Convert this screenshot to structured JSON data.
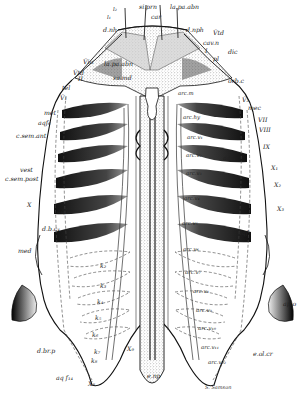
{
  "figure": {
    "type": "anatomical-diagram",
    "signature": "S. Samson",
    "colors": {
      "ink": "#1a1a1a",
      "paper": "#ffffff",
      "stipple": "#9a9a9a",
      "gill": "#2a2a2a"
    }
  },
  "labels": {
    "top": [
      {
        "id": "l2",
        "text": "l₂",
        "x": 113,
        "y": 7
      },
      {
        "id": "si_prn",
        "text": "si.prn",
        "x": 139,
        "y": 4
      },
      {
        "id": "la_pa_abn_top",
        "text": "la.pa.abn",
        "x": 170,
        "y": 4
      },
      {
        "id": "l1",
        "text": "l₁",
        "x": 107,
        "y": 15
      },
      {
        "id": "car",
        "text": "car",
        "x": 151,
        "y": 14
      },
      {
        "id": "d_nh",
        "text": "d.nh",
        "x": 103,
        "y": 27
      },
      {
        "id": "d_nph",
        "text": "d.nph",
        "x": 186,
        "y": 27
      },
      {
        "id": "V_td_r",
        "text": "V̄td",
        "x": 213,
        "y": 30
      },
      {
        "id": "cav_n",
        "text": "cav.n",
        "x": 203,
        "y": 40
      },
      {
        "id": "I",
        "text": "I",
        "x": 205,
        "y": 48
      },
      {
        "id": "dic",
        "text": "dic",
        "x": 228,
        "y": 49
      }
    ],
    "left": [
      {
        "id": "V_io",
        "text": "V̄io",
        "x": 83,
        "y": 59
      },
      {
        "id": "V_td_l",
        "text": "V̄td",
        "x": 73,
        "y": 70
      },
      {
        "id": "II",
        "text": "II",
        "x": 78,
        "y": 76
      },
      {
        "id": "tel",
        "text": "tel",
        "x": 62,
        "y": 85
      },
      {
        "id": "V_1",
        "text": "V̄₁",
        "x": 60,
        "y": 95
      },
      {
        "id": "met",
        "text": "met",
        "x": 44,
        "y": 110
      },
      {
        "id": "aq_f6",
        "text": "aqf₆",
        "x": 38,
        "y": 120
      },
      {
        "id": "c_sem_ant",
        "text": "c.sem.ant",
        "x": 16,
        "y": 133
      },
      {
        "id": "vest",
        "text": "vest",
        "x": 20,
        "y": 167
      },
      {
        "id": "c_sem_post",
        "text": "c.sem.post",
        "x": 5,
        "y": 176
      },
      {
        "id": "X_left",
        "text": "X",
        "x": 27,
        "y": 202
      },
      {
        "id": "aq_f6_b",
        "text": "aqf₆",
        "x": 57,
        "y": 208
      },
      {
        "id": "d_b_c_a",
        "text": "d.b.c₄",
        "x": 42,
        "y": 226
      },
      {
        "id": "med",
        "text": "med",
        "x": 18,
        "y": 248
      },
      {
        "id": "d_br_p",
        "text": "d.br.p",
        "x": 37,
        "y": 348
      },
      {
        "id": "aq_f14",
        "text": "aq f₁₄",
        "x": 56,
        "y": 375
      },
      {
        "id": "X_8",
        "text": "X₈",
        "x": 88,
        "y": 381
      }
    ],
    "center": [
      {
        "id": "la_pa_abn",
        "text": "la.pa.abn",
        "x": 104,
        "y": 61
      },
      {
        "id": "sa_md",
        "text": "sa.md",
        "x": 113,
        "y": 75
      },
      {
        "id": "k_2",
        "text": "k₂",
        "x": 100,
        "y": 263
      },
      {
        "id": "k_3",
        "text": "k₃",
        "x": 100,
        "y": 283
      },
      {
        "id": "k_4",
        "text": "k₄",
        "x": 97,
        "y": 299
      },
      {
        "id": "k_5",
        "text": "k₅",
        "x": 95,
        "y": 315
      },
      {
        "id": "k_6",
        "text": "k₆",
        "x": 92,
        "y": 332
      },
      {
        "id": "k_7",
        "text": "k₇",
        "x": 94,
        "y": 349
      },
      {
        "id": "k_8",
        "text": "k₈",
        "x": 91,
        "y": 358
      },
      {
        "id": "X_9",
        "text": "X₉",
        "x": 127,
        "y": 346
      },
      {
        "id": "e_np",
        "text": "e.np",
        "x": 147,
        "y": 373
      }
    ],
    "right": [
      {
        "id": "pl",
        "text": "pl",
        "x": 213,
        "y": 56
      },
      {
        "id": "orb_c",
        "text": "orb.c",
        "x": 228,
        "y": 78
      },
      {
        "id": "arc_m",
        "text": "arc.m",
        "x": 178,
        "y": 91
      },
      {
        "id": "V_3",
        "text": "V̄₃",
        "x": 242,
        "y": 97
      },
      {
        "id": "mec",
        "text": "mec",
        "x": 248,
        "y": 105
      },
      {
        "id": "arc_hy",
        "text": "arc.hy",
        "x": 183,
        "y": 115
      },
      {
        "id": "VII",
        "text": "VII",
        "x": 258,
        "y": 117
      },
      {
        "id": "VIII",
        "text": "VIII",
        "x": 259,
        "y": 127
      },
      {
        "id": "arc_v1",
        "text": "arc.v₁",
        "x": 187,
        "y": 135
      },
      {
        "id": "IX",
        "text": "IX",
        "x": 263,
        "y": 144
      },
      {
        "id": "arc_v2",
        "text": "arc.v₂",
        "x": 186,
        "y": 153
      },
      {
        "id": "aq_f4",
        "text": "aqf₄",
        "x": 223,
        "y": 155
      },
      {
        "id": "X_1",
        "text": "X₁",
        "x": 271,
        "y": 165
      },
      {
        "id": "arc_v3",
        "text": "arc.v₃",
        "x": 186,
        "y": 171
      },
      {
        "id": "X_2",
        "text": "X₂",
        "x": 274,
        "y": 182
      },
      {
        "id": "arc_v4",
        "text": "arc.v₄",
        "x": 184,
        "y": 196
      },
      {
        "id": "X_3",
        "text": "X₃",
        "x": 277,
        "y": 206
      },
      {
        "id": "arc_v5",
        "text": "arc.v₅",
        "x": 182,
        "y": 221
      },
      {
        "id": "aq_f7",
        "text": "aqf₇",
        "x": 238,
        "y": 230
      },
      {
        "id": "arc_v6",
        "text": "arc.v₆",
        "x": 183,
        "y": 247
      },
      {
        "id": "arc_v7",
        "text": "arc.v₇",
        "x": 185,
        "y": 270
      },
      {
        "id": "arc_v8",
        "text": "arc.v₈",
        "x": 193,
        "y": 289
      },
      {
        "id": "arc_v9",
        "text": "arc.v₉",
        "x": 196,
        "y": 308
      },
      {
        "id": "arc_v10",
        "text": "arc.v₁₀",
        "x": 198,
        "y": 326
      },
      {
        "id": "arc_v11",
        "text": "arc.v₁₁",
        "x": 201,
        "y": 345
      },
      {
        "id": "arc_v12",
        "text": "arc.v₁₂",
        "x": 208,
        "y": 360
      },
      {
        "id": "e_ol_cr",
        "text": "e.ol.cr",
        "x": 253,
        "y": 351
      },
      {
        "id": "ap_o",
        "text": "ap.o",
        "x": 283,
        "y": 301
      }
    ]
  }
}
